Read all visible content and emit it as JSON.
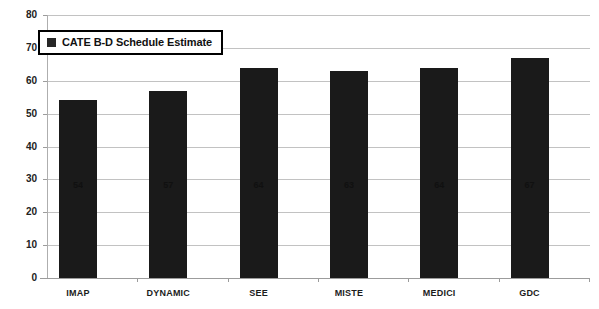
{
  "chart_data": {
    "type": "bar",
    "title": "",
    "xlabel": "",
    "ylabel": "",
    "categories": [
      "IMAP",
      "DYNAMIC",
      "SEE",
      "MISTE",
      "MEDICI",
      "GDC"
    ],
    "values": [
      54,
      57,
      64,
      63,
      64,
      67
    ],
    "series": [
      {
        "name": "CATE B-D Schedule Estimate",
        "values": [
          54,
          57,
          64,
          63,
          64,
          67
        ],
        "color": "#1a1a1a"
      }
    ],
    "ylim": [
      0,
      80
    ],
    "yticks": [
      0,
      10,
      20,
      30,
      40,
      50,
      60,
      70,
      80
    ],
    "ytick_labels": [
      "0",
      "10",
      "20",
      "30",
      "40",
      "50",
      "60",
      "70",
      "80"
    ],
    "grid": true,
    "grid_axis": "y",
    "legend": {
      "position": "top-left",
      "entries": [
        {
          "label": "CATE B-D Schedule Estimate",
          "marker": "square",
          "color": "#262626"
        }
      ]
    },
    "bar_value_labels": [
      "54",
      "57",
      "64",
      "63",
      "64",
      "67"
    ]
  },
  "legend": {
    "label": "CATE B-D Schedule Estimate"
  },
  "axes": {
    "y_labels": [
      "80",
      "70",
      "60",
      "50",
      "40",
      "30",
      "20",
      "10",
      "0"
    ],
    "x_labels": [
      "IMAP",
      "DYNAMIC",
      "SEE",
      "MISTE",
      "MEDICI",
      "GDC"
    ]
  },
  "bars": [
    {
      "category": "IMAP",
      "value": 54,
      "label": "54"
    },
    {
      "category": "DYNAMIC",
      "value": 57,
      "label": "57"
    },
    {
      "category": "SEE",
      "value": 64,
      "label": "64"
    },
    {
      "category": "MISTE",
      "value": 63,
      "label": "63"
    },
    {
      "category": "MEDICI",
      "value": 64,
      "label": "64"
    },
    {
      "category": "GDC",
      "value": 67,
      "label": "67"
    }
  ]
}
